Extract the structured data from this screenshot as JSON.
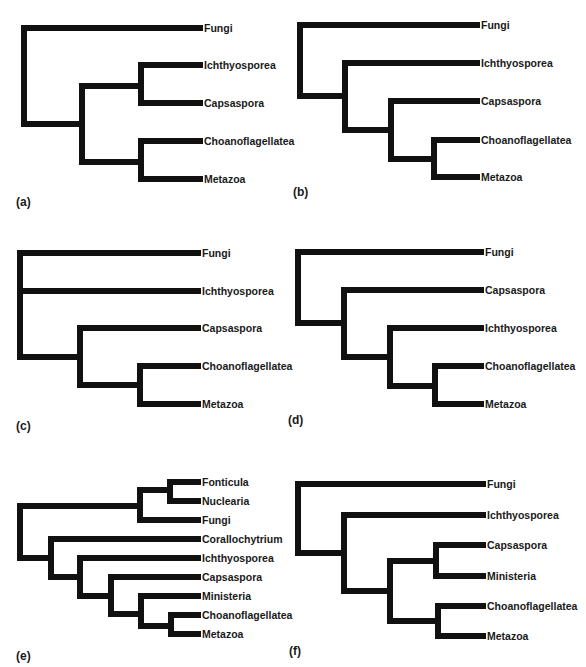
{
  "figure": {
    "panels": [
      {
        "id": "a",
        "label": "(a)",
        "taxa": [
          "Fungi",
          "Ichthyosporea",
          "Capsaspora",
          "Choanoflagellatea",
          "Metazoa"
        ],
        "topology": "(Fungi,((Ichthyosporea,Capsaspora),(Choanoflagellatea,Metazoa)))"
      },
      {
        "id": "b",
        "label": "(b)",
        "taxa": [
          "Fungi",
          "Ichthyosporea",
          "Capsaspora",
          "Choanoflagellatea",
          "Metazoa"
        ],
        "topology": "(Fungi,(Ichthyosporea,(Capsaspora,(Choanoflagellatea,Metazoa))))"
      },
      {
        "id": "c",
        "label": "(c)",
        "taxa": [
          "Fungi",
          "Ichthyosporea",
          "Capsaspora",
          "Choanoflagellatea",
          "Metazoa"
        ],
        "topology": "(Fungi,Ichthyosporea,(Capsaspora,(Choanoflagellatea,Metazoa)))"
      },
      {
        "id": "d",
        "label": "(d)",
        "taxa": [
          "Fungi",
          "Capsaspora",
          "Ichthyosporea",
          "Choanoflagellatea",
          "Metazoa"
        ],
        "topology": "(Fungi,(Capsaspora,(Ichthyosporea,(Choanoflagellatea,Metazoa))))"
      },
      {
        "id": "e",
        "label": "(e)",
        "taxa": [
          "Fonticula",
          "Nuclearia",
          "Fungi",
          "Corallochytrium",
          "Ichthyosporea",
          "Capsaspora",
          "Ministeria",
          "Choanoflagellatea",
          "Metazoa"
        ],
        "topology": "(((Fonticula,Nuclearia),Fungi),(Corallochytrium,(Ichthyosporea,(Capsaspora,(Ministeria,(Choanoflagellatea,Metazoa))))))"
      },
      {
        "id": "f",
        "label": "(f)",
        "taxa": [
          "Fungi",
          "Ichthyosporea",
          "Capsaspora",
          "Ministeria",
          "Choanoflagellatea",
          "Metazoa"
        ],
        "topology": "(Fungi,(Ichthyosporea,((Capsaspora,Ministeria),(Choanoflagellatea,Metazoa))))"
      }
    ]
  },
  "colors": {
    "branch": "#111111",
    "text": "#1a1a1a",
    "background": "#ffffff"
  }
}
